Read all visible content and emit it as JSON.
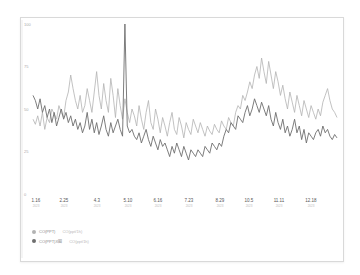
{
  "chart_data": {
    "type": "line",
    "title": "",
    "xlabel": "",
    "ylabel": "",
    "ylim": [
      0,
      100
    ],
    "yticks": [
      0,
      25,
      50,
      75,
      100
    ],
    "x_tick_labels": [
      "1.16",
      "2.25",
      "4.3",
      "5.10",
      "6.16",
      "7.23",
      "8.29",
      "10.5",
      "11.11",
      "12.18"
    ],
    "grid": false,
    "legend_position": "bottom-left",
    "series": [
      {
        "name": "CO(PPT)",
        "unit_label": "CO(ppt/1h)",
        "color": "#b3b3b3",
        "values": [
          44,
          41,
          46,
          40,
          48,
          38,
          45,
          42,
          50,
          47,
          44,
          52,
          48,
          45,
          55,
          60,
          70,
          62,
          55,
          50,
          58,
          48,
          52,
          62,
          55,
          48,
          60,
          72,
          58,
          50,
          65,
          55,
          48,
          68,
          58,
          45,
          62,
          52,
          44,
          56,
          48,
          42,
          50,
          46,
          40,
          52,
          44,
          38,
          48,
          55,
          42,
          38,
          50,
          44,
          36,
          45,
          40,
          34,
          42,
          48,
          38,
          35,
          45,
          40,
          33,
          42,
          38,
          35,
          44,
          40,
          36,
          42,
          38,
          34,
          40,
          37,
          35,
          41,
          38,
          36,
          43,
          40,
          38,
          45,
          42,
          40,
          48,
          52,
          50,
          58,
          55,
          60,
          66,
          62,
          70,
          75,
          68,
          80,
          72,
          65,
          78,
          70,
          62,
          72,
          66,
          58,
          64,
          56,
          50,
          60,
          54,
          48,
          58,
          52,
          46,
          55,
          50,
          45,
          52,
          48,
          44,
          50,
          46,
          54,
          58,
          62,
          55,
          50,
          48,
          45
        ]
      },
      {
        "name": "CO(PPT)X圈",
        "unit_label": "CO(ppt/1h)",
        "color": "#6e6e6e",
        "values": [
          58,
          55,
          50,
          56,
          48,
          52,
          45,
          50,
          42,
          48,
          40,
          45,
          50,
          44,
          48,
          42,
          46,
          40,
          44,
          38,
          42,
          36,
          40,
          48,
          38,
          44,
          36,
          42,
          35,
          40,
          46,
          38,
          34,
          42,
          36,
          40,
          44,
          38,
          34,
          100,
          40,
          36,
          38,
          34,
          32,
          36,
          30,
          34,
          38,
          32,
          28,
          34,
          30,
          26,
          32,
          28,
          30,
          26,
          22,
          28,
          24,
          30,
          26,
          22,
          28,
          24,
          20,
          26,
          24,
          22,
          26,
          24,
          22,
          28,
          26,
          24,
          30,
          28,
          26,
          30,
          28,
          34,
          38,
          36,
          42,
          40,
          38,
          46,
          44,
          42,
          48,
          52,
          46,
          50,
          56,
          52,
          48,
          54,
          50,
          46,
          52,
          44,
          40,
          48,
          42,
          38,
          44,
          36,
          40,
          34,
          38,
          44,
          36,
          40,
          32,
          38,
          30,
          36,
          34,
          32,
          36,
          38,
          34,
          40,
          36,
          38,
          34,
          32,
          35,
          33
        ]
      }
    ]
  },
  "legend": {
    "items": [
      {
        "label": "CO(PPT)",
        "sub": "CO(ppt/1h)",
        "color": "#b3b3b3"
      },
      {
        "label": "CO(PPT)X圈",
        "sub": "CO(ppt/1h)",
        "color": "#6e6e6e"
      }
    ]
  },
  "x_sub_label": "2023"
}
